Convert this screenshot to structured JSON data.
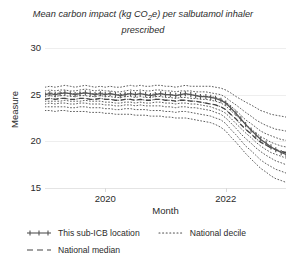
{
  "chart_data": {
    "type": "line",
    "title": "Mean carbon impact (kg CO2e) per salbutamol inhaler prescribed",
    "title_html": "Mean carbon impact (kg CO₂e) per salbutamol inhaler prescribed",
    "xlabel": "Month",
    "ylabel": "Measure",
    "ylim": [
      15,
      30
    ],
    "yticks": [
      15,
      20,
      25,
      30
    ],
    "ytick_labels": [
      "15",
      "20",
      "25",
      "30"
    ],
    "xlim": [
      2019.0,
      2023.0
    ],
    "xticks": [
      2020,
      2022
    ],
    "xtick_labels": [
      "2020",
      "2022"
    ],
    "grid": true,
    "legend_position": "bottom-left",
    "x": [
      2019.0,
      2019.08,
      2019.17,
      2019.25,
      2019.33,
      2019.42,
      2019.5,
      2019.58,
      2019.67,
      2019.75,
      2019.83,
      2019.92,
      2020.0,
      2020.08,
      2020.17,
      2020.25,
      2020.33,
      2020.42,
      2020.5,
      2020.58,
      2020.67,
      2020.75,
      2020.83,
      2020.92,
      2021.0,
      2021.08,
      2021.17,
      2021.25,
      2021.33,
      2021.42,
      2021.5,
      2021.58,
      2021.67,
      2021.75,
      2021.83,
      2021.92,
      2022.0,
      2022.08,
      2022.17,
      2022.25,
      2022.33,
      2022.42,
      2022.5,
      2022.58,
      2022.67,
      2022.75,
      2022.83,
      2022.92,
      2023.0
    ],
    "series": [
      {
        "name": "This sub-ICB location",
        "style": "solid-marker",
        "color": "#555555",
        "values": [
          25.0,
          25.1,
          25.0,
          25.1,
          25.2,
          25.1,
          25.0,
          25.1,
          25.2,
          25.1,
          25.0,
          25.1,
          25.0,
          25.1,
          25.0,
          24.9,
          25.0,
          25.1,
          25.0,
          25.1,
          25.0,
          24.9,
          25.0,
          25.1,
          25.0,
          25.0,
          24.9,
          25.0,
          25.1,
          25.0,
          24.9,
          24.8,
          24.8,
          24.7,
          24.6,
          24.4,
          24.1,
          23.6,
          23.0,
          22.4,
          21.8,
          21.2,
          20.7,
          20.2,
          19.8,
          19.4,
          19.1,
          18.8,
          18.6
        ]
      },
      {
        "name": "National median",
        "style": "dashed",
        "color": "#444444",
        "values": [
          24.5,
          24.6,
          24.5,
          24.6,
          24.6,
          24.5,
          24.5,
          24.6,
          24.6,
          24.5,
          24.5,
          24.6,
          24.5,
          24.5,
          24.4,
          24.4,
          24.5,
          24.5,
          24.4,
          24.5,
          24.4,
          24.4,
          24.5,
          24.5,
          24.4,
          24.4,
          24.3,
          24.4,
          24.4,
          24.3,
          24.3,
          24.2,
          24.1,
          24.0,
          23.9,
          23.7,
          23.4,
          22.9,
          22.4,
          21.8,
          21.3,
          20.8,
          20.3,
          19.9,
          19.6,
          19.3,
          19.1,
          18.9,
          18.8
        ]
      }
    ],
    "deciles": {
      "name": "National decile",
      "style": "dotted",
      "color": "#4d4d4d",
      "labels": [
        "10th",
        "20th",
        "30th",
        "40th",
        "50th",
        "60th",
        "70th",
        "80th",
        "90th"
      ],
      "bands": [
        [
          23.3,
          23.3,
          23.2,
          23.3,
          23.3,
          23.2,
          23.2,
          23.2,
          23.2,
          23.1,
          23.1,
          23.1,
          23.0,
          23.0,
          22.9,
          22.9,
          22.9,
          22.9,
          22.8,
          22.8,
          22.8,
          22.7,
          22.7,
          22.7,
          22.6,
          22.6,
          22.5,
          22.5,
          22.5,
          22.4,
          22.3,
          22.2,
          22.1,
          22.0,
          21.8,
          21.5,
          21.1,
          20.5,
          19.9,
          19.3,
          18.7,
          18.1,
          17.6,
          17.1,
          16.7,
          16.3,
          16.0,
          15.8,
          15.6
        ],
        [
          23.7,
          23.7,
          23.7,
          23.7,
          23.7,
          23.6,
          23.6,
          23.7,
          23.7,
          23.6,
          23.6,
          23.6,
          23.5,
          23.5,
          23.4,
          23.4,
          23.5,
          23.5,
          23.4,
          23.4,
          23.4,
          23.3,
          23.3,
          23.3,
          23.2,
          23.2,
          23.1,
          23.2,
          23.2,
          23.1,
          23.0,
          22.9,
          22.8,
          22.7,
          22.5,
          22.3,
          21.9,
          21.3,
          20.7,
          20.1,
          19.5,
          19.0,
          18.5,
          18.0,
          17.6,
          17.3,
          17.0,
          16.8,
          16.6
        ],
        [
          24.0,
          24.1,
          24.0,
          24.1,
          24.1,
          24.0,
          24.0,
          24.1,
          24.1,
          24.0,
          24.0,
          24.0,
          23.9,
          23.9,
          23.8,
          23.8,
          23.9,
          23.9,
          23.8,
          23.9,
          23.8,
          23.8,
          23.8,
          23.8,
          23.7,
          23.7,
          23.6,
          23.7,
          23.7,
          23.6,
          23.6,
          23.5,
          23.4,
          23.3,
          23.1,
          22.9,
          22.5,
          22.0,
          21.4,
          20.8,
          20.3,
          19.8,
          19.3,
          18.9,
          18.5,
          18.2,
          17.9,
          17.7,
          17.5
        ],
        [
          24.3,
          24.3,
          24.3,
          24.3,
          24.4,
          24.3,
          24.3,
          24.3,
          24.4,
          24.3,
          24.3,
          24.3,
          24.2,
          24.2,
          24.1,
          24.1,
          24.2,
          24.2,
          24.1,
          24.2,
          24.1,
          24.1,
          24.2,
          24.2,
          24.1,
          24.1,
          24.0,
          24.1,
          24.1,
          24.0,
          24.0,
          23.9,
          23.8,
          23.7,
          23.5,
          23.3,
          23.0,
          22.5,
          21.9,
          21.4,
          20.9,
          20.4,
          19.9,
          19.5,
          19.1,
          18.8,
          18.6,
          18.4,
          18.2
        ],
        [
          24.5,
          24.6,
          24.5,
          24.6,
          24.6,
          24.5,
          24.5,
          24.6,
          24.6,
          24.5,
          24.5,
          24.6,
          24.5,
          24.5,
          24.4,
          24.4,
          24.5,
          24.5,
          24.4,
          24.5,
          24.4,
          24.4,
          24.5,
          24.5,
          24.4,
          24.4,
          24.3,
          24.4,
          24.4,
          24.3,
          24.3,
          24.2,
          24.1,
          24.0,
          23.9,
          23.7,
          23.4,
          22.9,
          22.4,
          21.8,
          21.3,
          20.8,
          20.3,
          19.9,
          19.6,
          19.3,
          19.1,
          18.9,
          18.8
        ],
        [
          24.8,
          24.9,
          24.8,
          24.9,
          24.9,
          24.8,
          24.8,
          24.9,
          24.9,
          24.8,
          24.8,
          24.9,
          24.8,
          24.8,
          24.7,
          24.7,
          24.8,
          24.8,
          24.7,
          24.8,
          24.7,
          24.7,
          24.8,
          24.8,
          24.7,
          24.7,
          24.6,
          24.7,
          24.7,
          24.6,
          24.6,
          24.5,
          24.5,
          24.4,
          24.3,
          24.1,
          23.8,
          23.3,
          22.8,
          22.3,
          21.8,
          21.3,
          20.9,
          20.5,
          20.2,
          19.9,
          19.7,
          19.5,
          19.4
        ],
        [
          25.1,
          25.2,
          25.1,
          25.2,
          25.2,
          25.1,
          25.1,
          25.2,
          25.2,
          25.1,
          25.1,
          25.2,
          25.1,
          25.1,
          25.0,
          25.0,
          25.1,
          25.1,
          25.0,
          25.1,
          25.0,
          25.0,
          25.1,
          25.1,
          25.0,
          25.0,
          24.9,
          25.0,
          25.0,
          25.0,
          24.9,
          24.9,
          24.8,
          24.8,
          24.7,
          24.5,
          24.2,
          23.8,
          23.3,
          22.8,
          22.3,
          21.9,
          21.5,
          21.1,
          20.8,
          20.6,
          20.4,
          20.2,
          20.1
        ],
        [
          25.4,
          25.5,
          25.4,
          25.5,
          25.5,
          25.4,
          25.4,
          25.5,
          25.6,
          25.5,
          25.4,
          25.5,
          25.4,
          25.4,
          25.3,
          25.3,
          25.4,
          25.5,
          25.4,
          25.5,
          25.4,
          25.4,
          25.5,
          25.5,
          25.4,
          25.4,
          25.3,
          25.4,
          25.4,
          25.4,
          25.3,
          25.3,
          25.3,
          25.2,
          25.1,
          25.0,
          24.7,
          24.3,
          23.9,
          23.5,
          23.1,
          22.7,
          22.3,
          22.0,
          21.7,
          21.5,
          21.3,
          21.2,
          21.1
        ],
        [
          25.8,
          25.9,
          25.8,
          25.9,
          26.0,
          25.9,
          25.8,
          25.9,
          26.0,
          25.9,
          25.8,
          25.9,
          25.8,
          25.9,
          25.8,
          25.8,
          25.9,
          26.0,
          25.9,
          26.0,
          25.9,
          25.9,
          26.0,
          26.0,
          25.9,
          25.9,
          25.8,
          25.9,
          26.0,
          25.9,
          25.9,
          25.9,
          25.9,
          25.9,
          25.8,
          25.7,
          25.5,
          25.2,
          24.8,
          24.5,
          24.2,
          23.9,
          23.6,
          23.3,
          23.1,
          22.9,
          22.8,
          22.7,
          22.6
        ]
      ]
    }
  },
  "legend": {
    "items": [
      {
        "label": "This sub-ICB location",
        "style": "solid-marker"
      },
      {
        "label": "National decile",
        "style": "dotted"
      },
      {
        "label": "National median",
        "style": "dashed"
      }
    ]
  },
  "colors": {
    "line": "#555555",
    "median": "#444444",
    "decile": "#4d4d4d",
    "grid": "#eeeeee",
    "text": "#2b2b2b"
  }
}
